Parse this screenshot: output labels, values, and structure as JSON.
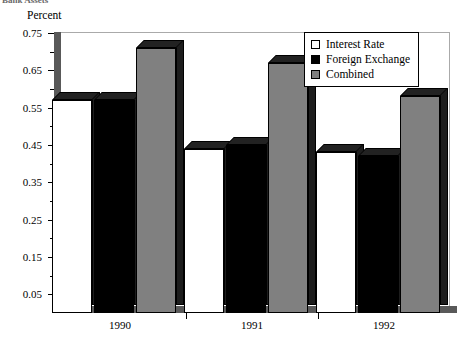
{
  "figure": {
    "clipped_caption": "Bank Assets",
    "axis_title": "Percent"
  },
  "chart_data": {
    "type": "bar",
    "title": "",
    "xlabel": "",
    "ylabel": "Percent",
    "categories": [
      "1990",
      "1991",
      "1992"
    ],
    "series": [
      {
        "name": "Interest Rate",
        "color": "#ffffff",
        "values": [
          0.57,
          0.44,
          0.43
        ]
      },
      {
        "name": "Foreign Exchange",
        "color": "#000000",
        "values": [
          0.57,
          0.45,
          0.42
        ]
      },
      {
        "name": "Combined",
        "color": "#808080",
        "values": [
          0.71,
          0.67,
          0.58
        ]
      }
    ],
    "ylim": [
      0.0,
      0.775
    ],
    "yticks": [
      0.05,
      0.15,
      0.25,
      0.35,
      0.45,
      0.55,
      0.65,
      0.75
    ],
    "ytick_labels": [
      "0.05",
      "0.15",
      "0.25",
      "0.35",
      "0.45",
      "0.55",
      "0.65",
      "0.75"
    ],
    "yminor_ticks": [
      0.1,
      0.2,
      0.3,
      0.4,
      0.5,
      0.6,
      0.7
    ],
    "grid": false,
    "legend_position": "top-right",
    "style": "3d-bar"
  },
  "legend": {
    "entries": [
      {
        "label": "Interest Rate"
      },
      {
        "label": "Foreign Exchange"
      },
      {
        "label": "Combined"
      }
    ]
  }
}
